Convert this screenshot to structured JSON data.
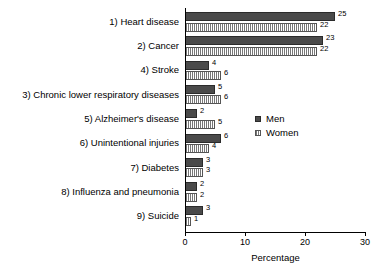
{
  "chart_data": {
    "type": "bar",
    "orientation": "horizontal",
    "title": "",
    "xlabel": "Percentage",
    "ylabel": "",
    "xlim": [
      0,
      30
    ],
    "xticks": [
      0,
      10,
      20,
      30
    ],
    "grid": false,
    "legend_position": "center-right",
    "categories": [
      "1) Heart disease",
      "2) Cancer",
      "4) Stroke",
      "3) Chronic lower respiratory diseases",
      "5) Alzheimer's disease",
      "6) Unintentional injuries",
      "7) Diabetes",
      "8) Influenza and pneumonia",
      "9) Suicide"
    ],
    "series": [
      {
        "name": "Men",
        "values": [
          25,
          23,
          4,
          5,
          2,
          6,
          3,
          2,
          3
        ],
        "color": "#4a4a4a",
        "pattern": "solid"
      },
      {
        "name": "Women",
        "values": [
          22,
          22,
          6,
          6,
          5,
          4,
          3,
          2,
          1
        ],
        "color": "#ffffff",
        "pattern": "vertical-hatch"
      }
    ]
  },
  "legend": {
    "items": [
      {
        "label": "Men"
      },
      {
        "label": "Women"
      }
    ]
  },
  "axis": {
    "x_title": "Percentage",
    "tick_labels": [
      "0",
      "10",
      "20",
      "30"
    ]
  }
}
